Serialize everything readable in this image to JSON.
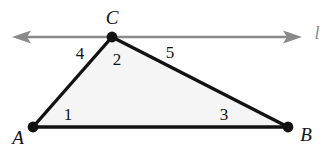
{
  "figure": {
    "background_color": "#ffffff",
    "colors": {
      "edge": "#121212",
      "vertex_dot": "#121212",
      "interior_fill": "#f5f5f5",
      "line_l": "#8a8a8a",
      "label_text": "#121212",
      "line_label_text": "#8a8a8a"
    },
    "geometry": {
      "points": {
        "A": {
          "x": 33,
          "y": 127
        },
        "B": {
          "x": 288,
          "y": 127
        },
        "C": {
          "x": 112,
          "y": 37
        }
      },
      "line_l": {
        "x1": 13,
        "y1": 37,
        "x2": 301,
        "y2": 37,
        "arrows": "both"
      },
      "edges": [
        {
          "name": "AB",
          "from": "A",
          "to": "B"
        },
        {
          "name": "AC",
          "from": "A",
          "to": "C"
        },
        {
          "name": "CB",
          "from": "C",
          "to": "B"
        }
      ]
    },
    "vertex_labels": [
      {
        "id": "label-C",
        "text": "C",
        "x": 112,
        "y": 17
      },
      {
        "id": "label-A",
        "text": "A",
        "x": 18,
        "y": 137
      },
      {
        "id": "label-B",
        "text": "B",
        "x": 306,
        "y": 134
      }
    ],
    "angle_labels": [
      {
        "id": "angle-4",
        "text": "4",
        "x": 80,
        "y": 53
      },
      {
        "id": "angle-2",
        "text": "2",
        "x": 117,
        "y": 59
      },
      {
        "id": "angle-5",
        "text": "5",
        "x": 170,
        "y": 52
      },
      {
        "id": "angle-1",
        "text": "1",
        "x": 68,
        "y": 114
      },
      {
        "id": "angle-3",
        "text": "3",
        "x": 224,
        "y": 114
      }
    ],
    "line_label": {
      "id": "label-l",
      "text": "l",
      "x": 317,
      "y": 33
    }
  }
}
